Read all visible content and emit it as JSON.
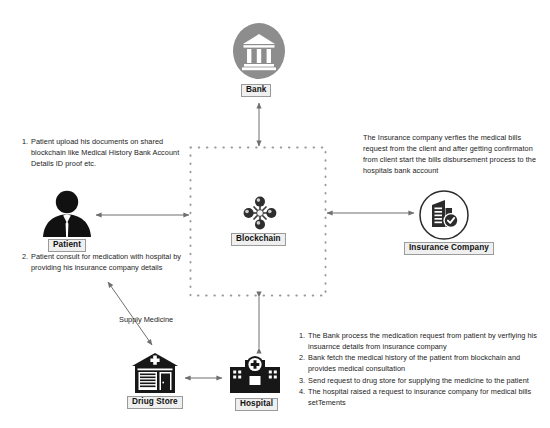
{
  "diagram": {
    "background": "#ffffff",
    "ink": "#1a1a1a",
    "bank_icon_fill": "#8d8d8d",
    "arrow_color": "#6f6f6f",
    "dotted_box_color": "#9a9a9a",
    "label_bg": "#efefef",
    "label_border": "#9a9a9a"
  },
  "nodes": {
    "bank": {
      "label": "Bank",
      "icon": "bank-building-icon"
    },
    "blockchain": {
      "label": "Blockchain",
      "icon": "blockchain-nodes-icon"
    },
    "patient": {
      "label": "Patient",
      "icon": "patient-person-icon"
    },
    "insurance": {
      "label": "Insurance Company",
      "icon": "insurance-building-check-icon"
    },
    "drugstore": {
      "label": "Driug Store",
      "icon": "drug-store-icon"
    },
    "hospital": {
      "label": "Hospital",
      "icon": "hospital-building-icon"
    }
  },
  "edges": {
    "supply_medicine": "Supply Medicine"
  },
  "texts": {
    "patient_step_1": {
      "number": "1.",
      "body": "Patient upload his documents on shared blockchain like Medical History Bank Account Details ID proof etc."
    },
    "patient_step_2": {
      "number": "2.",
      "body": "Patient consult for medication with hospital by providing his insurance company details"
    },
    "insurance_note": "The Insurance company verfies the medical bills request from the client and after getting confirmaton from client start the bills disbursement process to the hospitals bank account",
    "hospital_steps": [
      {
        "number": "1.",
        "body": "The Bank process the medication request from patient by verflying his insuarnce details from insurance company"
      },
      {
        "number": "2.",
        "body": "Bank fetch the medical history of the patient from blockchain and provides medical consultation"
      },
      {
        "number": "3.",
        "body": "Send request to drug store for supplying the medicine to the patient"
      },
      {
        "number": "4.",
        "body": "The hospital raised a request to insurance company for medical bills setTements"
      }
    ]
  }
}
